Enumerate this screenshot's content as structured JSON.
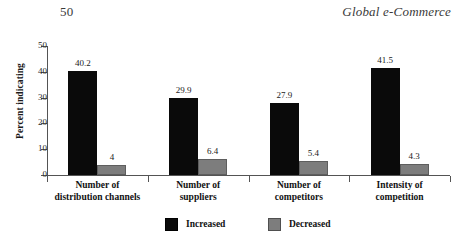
{
  "page": {
    "number": "50",
    "running_head": "Global e-Commerce"
  },
  "colors": {
    "increased": "#000000",
    "decreased": "#7d7d7d",
    "axis": "#545454",
    "text": "#111111",
    "background": "#ffffff"
  },
  "legend": {
    "increased_label": "Increased",
    "decreased_label": "Decreased"
  },
  "chart_data": {
    "type": "bar",
    "title": "",
    "subtitle": "",
    "xlabel": "",
    "ylabel": "Percent indicating",
    "ylim": [
      0,
      50
    ],
    "ytick_labels": [
      "0",
      "10",
      "20",
      "30",
      "40",
      "50"
    ],
    "ytick_values": [
      0,
      10,
      20,
      30,
      40,
      50
    ],
    "grid": false,
    "legend_position": "bottom",
    "categories": [
      "Number of distribution channels",
      "Number of suppliers",
      "Number of competitors",
      "Intensity of competition"
    ],
    "category_lines": [
      [
        "Number of",
        "distribution channels"
      ],
      [
        "Number of",
        "suppliers"
      ],
      [
        "Number of",
        "competitors"
      ],
      [
        "Intensity of",
        "competition"
      ]
    ],
    "series": [
      {
        "name": "Increased",
        "color": "#000000",
        "values": [
          40.2,
          29.9,
          27.9,
          41.5
        ],
        "labels": [
          "40.2",
          "29.9",
          "27.9",
          "41.5"
        ]
      },
      {
        "name": "Decreased",
        "color": "#7d7d7d",
        "values": [
          4,
          6.4,
          5.4,
          4.3
        ],
        "labels": [
          "4",
          "6.4",
          "5.4",
          "4.3"
        ]
      }
    ]
  }
}
